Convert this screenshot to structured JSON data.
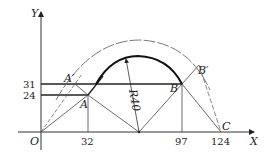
{
  "diagram": {
    "type": "geometry-construction",
    "axes": {
      "x_label": "X",
      "y_label": "Y",
      "origin_label": "O"
    },
    "x_ticks": [
      "32",
      "97",
      "124"
    ],
    "y_ticks": [
      "31",
      "24"
    ],
    "points": {
      "A": "A",
      "A_prime": "A′",
      "B": "B",
      "B_prime": "B′",
      "C": "C"
    },
    "radius_label": "R40",
    "colors": {
      "line": "#333333",
      "thick_arc": "#111111",
      "thin": "#555555"
    }
  }
}
